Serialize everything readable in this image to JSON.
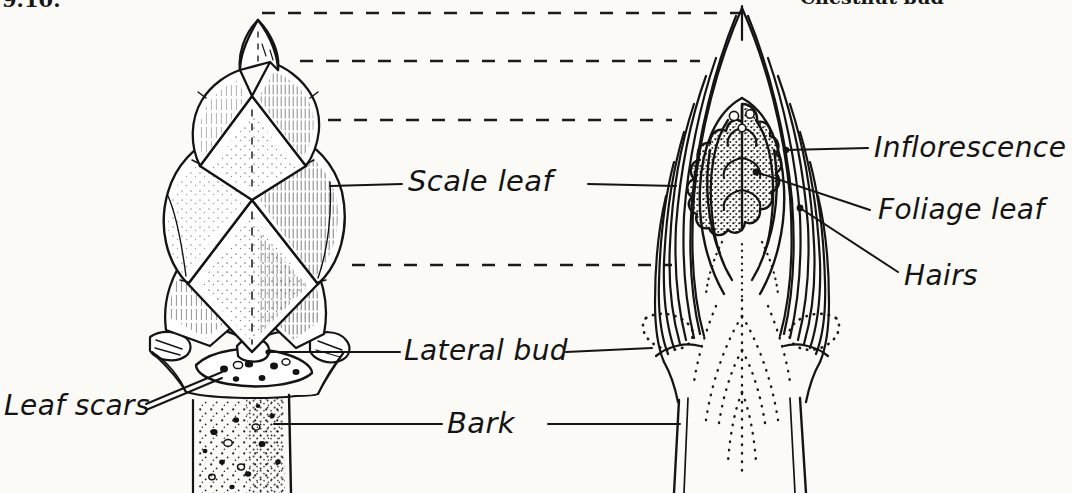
{
  "figure": {
    "number": "9.10.",
    "caption": "Chestnut bud",
    "background_color": "#fbfaf7",
    "ink_color": "#141414"
  },
  "labels": {
    "scale_leaf": "Scale leaf",
    "lateral_bud": "Lateral bud",
    "bark": "Bark",
    "leaf_scars": "Leaf scars",
    "inflorescence": "Inflorescence",
    "foliage_leaf": "Foliage leaf",
    "hairs": "Hairs"
  },
  "diagram": {
    "type": "botanical-line-drawing",
    "panels": [
      {
        "name": "exterior-bud",
        "description": "Whole chestnut bud in side view with overlapping stippled scale leaves, swollen base, leaf scars and stippled bark on the twig"
      },
      {
        "name": "longitudinal-section",
        "description": "Cut-away of the same bud showing nested scale leaf layers, a stippled inflorescence core, folded foliage leaves and dotted hair lines"
      }
    ],
    "alignment_guides": 4
  }
}
